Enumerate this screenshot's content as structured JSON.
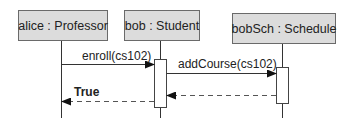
{
  "diagram": {
    "type": "UML sequence diagram",
    "participants": [
      {
        "id": "alice",
        "label": "alice : Professor"
      },
      {
        "id": "bob",
        "label": "bob : Student"
      },
      {
        "id": "bobSch",
        "label": "bobSch : Schedule"
      }
    ],
    "messages": [
      {
        "from": "alice",
        "to": "bob",
        "label": "enroll(cs102)",
        "kind": "synchronous"
      },
      {
        "from": "bob",
        "to": "bobSch",
        "label": "addCourse(cs102)",
        "kind": "synchronous"
      },
      {
        "from": "bobSch",
        "to": "bob",
        "label": "",
        "kind": "return"
      },
      {
        "from": "bob",
        "to": "alice",
        "label": "True",
        "kind": "return"
      }
    ],
    "colors": {
      "box_fill": "#dcdcdc",
      "box_border": "#6a6a6a",
      "line": "#333333",
      "return_line": "#555555"
    }
  }
}
